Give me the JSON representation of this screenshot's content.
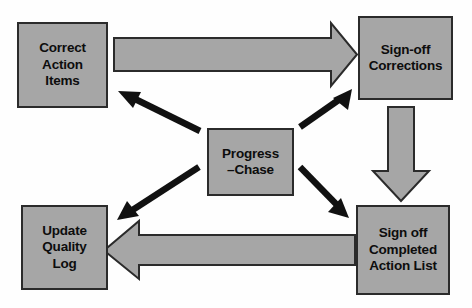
{
  "diagram": {
    "type": "flow-diagram",
    "colors": {
      "node_fill": "#a6a6a6",
      "node_stroke": "#2b2b2b",
      "block_arrow_fill": "#a6a6a6",
      "block_arrow_stroke": "#2b2b2b",
      "line_arrow_fill": "#111111",
      "background": "#fefefe"
    },
    "nodes": [
      {
        "id": "correct-action-items",
        "lines": [
          "Correct",
          "Action",
          "Items"
        ],
        "position": "top-left"
      },
      {
        "id": "sign-off-corrections",
        "lines": [
          "Sign-off",
          "Corrections"
        ],
        "position": "top-right"
      },
      {
        "id": "progress-chase",
        "lines": [
          "Progress",
          "–Chase"
        ],
        "position": "center"
      },
      {
        "id": "update-quality-log",
        "lines": [
          "Update",
          "Quality",
          "Log"
        ],
        "position": "bottom-left"
      },
      {
        "id": "sign-off-completed-action-list",
        "lines": [
          "Sign off",
          "Completed",
          "Action List"
        ],
        "position": "bottom-right"
      }
    ],
    "connectors": [
      {
        "id": "correct-action-items-to-sign-off-corrections",
        "style": "block-arrow",
        "direction": "right",
        "from": "correct-action-items",
        "to": "sign-off-corrections"
      },
      {
        "id": "sign-off-corrections-to-sign-off-completed",
        "style": "block-arrow",
        "direction": "down",
        "from": "sign-off-corrections",
        "to": "sign-off-completed-action-list"
      },
      {
        "id": "sign-off-completed-to-update-quality-log",
        "style": "block-arrow",
        "direction": "left",
        "from": "sign-off-completed-action-list",
        "to": "update-quality-log"
      },
      {
        "id": "progress-chase-to-correct-action-items",
        "style": "line-arrow",
        "direction": "up-left",
        "from": "progress-chase",
        "to": "correct-action-items"
      },
      {
        "id": "progress-chase-to-sign-off-corrections",
        "style": "line-arrow",
        "direction": "up-right",
        "from": "progress-chase",
        "to": "sign-off-corrections"
      },
      {
        "id": "progress-chase-to-update-quality-log",
        "style": "line-arrow",
        "direction": "down-left",
        "from": "progress-chase",
        "to": "update-quality-log"
      },
      {
        "id": "progress-chase-to-sign-off-completed",
        "style": "line-arrow",
        "direction": "down-right",
        "from": "progress-chase",
        "to": "sign-off-completed-action-list"
      }
    ]
  }
}
